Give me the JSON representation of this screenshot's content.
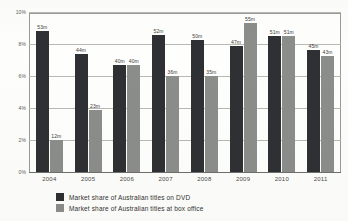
{
  "chart_data": {
    "type": "bar",
    "title": "",
    "subtitle": "",
    "xlabel": "",
    "ylabel": "",
    "ylim": [
      0,
      10
    ],
    "ytick_labels": [
      "10%",
      "8%",
      "6%",
      "4%",
      "2%",
      "0%"
    ],
    "ytick_values": [
      10,
      8,
      6,
      4,
      2,
      0
    ],
    "grid": true,
    "legend_position": "bottom-left",
    "categories": [
      "2004",
      "2005",
      "2006",
      "2007",
      "2008",
      "2009",
      "2010",
      "2011"
    ],
    "series": [
      {
        "name": "Market share of Australian titles on DVD",
        "color": "#2f3033",
        "values": [
          8.9,
          7.5,
          6.8,
          8.7,
          8.35,
          8.0,
          8.6,
          7.7
        ],
        "point_labels": [
          "53m",
          "44m",
          "40m",
          "52m",
          "50m",
          "47m",
          "51m",
          "45m"
        ]
      },
      {
        "name": "Market share of Australian titles at box office",
        "color": "#8b8d8a",
        "values": [
          2.0,
          3.95,
          6.8,
          6.1,
          6.05,
          9.4,
          8.6,
          7.35
        ],
        "point_labels": [
          "12m",
          "23m",
          "40m",
          "36m",
          "35m",
          "55m",
          "51m",
          "43m"
        ]
      }
    ]
  },
  "legend": {
    "items": [
      {
        "label": "Market share of Australian titles on DVD",
        "color": "#2f3033"
      },
      {
        "label": "Market share of Australian titles at box office",
        "color": "#8b8d8a"
      }
    ]
  }
}
